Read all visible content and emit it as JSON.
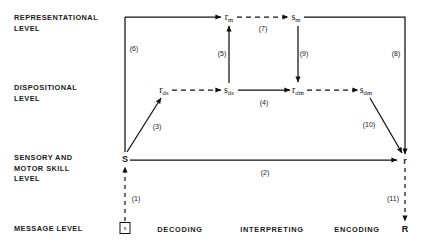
{
  "diagram": {
    "row_labels": [
      {
        "id": "representational",
        "text": "REPRESENTATIONAL\nLEVEL",
        "x": 14,
        "y": 13
      },
      {
        "id": "dispositional",
        "text": "DISPOSITIONAL\nLEVEL",
        "x": 14,
        "y": 83
      },
      {
        "id": "sensory-motor",
        "text": "SENSORY AND\nMOTOR SKILL\nLEVEL",
        "x": 14,
        "y": 153
      },
      {
        "id": "message",
        "text": "MESSAGE LEVEL",
        "x": 14,
        "y": 224
      }
    ],
    "nodes": [
      {
        "id": "r-m",
        "base": "r",
        "sub": "m",
        "x": 229,
        "y": 17,
        "style": "italic"
      },
      {
        "id": "s-m",
        "base": "s",
        "sub": "m",
        "x": 296,
        "y": 17,
        "style": "italic"
      },
      {
        "id": "r-ds",
        "base": "r",
        "sub": "ds",
        "x": 164,
        "y": 90,
        "style": "italic"
      },
      {
        "id": "s-ds",
        "base": "s",
        "sub": "ds",
        "x": 229,
        "y": 90,
        "style": "italic"
      },
      {
        "id": "r-dm",
        "base": "r",
        "sub": "dm",
        "x": 298,
        "y": 90,
        "style": "italic"
      },
      {
        "id": "s-dm",
        "base": "s",
        "sub": "dm",
        "x": 366,
        "y": 90,
        "style": "italic"
      },
      {
        "id": "S",
        "base": "S",
        "sub": "",
        "x": 125,
        "y": 159,
        "style": "big"
      },
      {
        "id": "r",
        "base": "r",
        "sub": "",
        "x": 405,
        "y": 161,
        "style": "big"
      },
      {
        "id": "R",
        "base": "R",
        "sub": "",
        "x": 405,
        "y": 229,
        "style": "big"
      }
    ],
    "message_box": {
      "id": "message-stimulus",
      "label": "s",
      "x": 125,
      "y": 228
    },
    "edge_labels": [
      {
        "id": "edge-1",
        "text": "(1)",
        "x": 136,
        "y": 198
      },
      {
        "id": "edge-2",
        "text": "(2)",
        "x": 265,
        "y": 172
      },
      {
        "id": "edge-3",
        "text": "(3)",
        "x": 157,
        "y": 126
      },
      {
        "id": "edge-4",
        "text": "(4)",
        "x": 264,
        "y": 102
      },
      {
        "id": "edge-5",
        "text": "(5)",
        "x": 222,
        "y": 53
      },
      {
        "id": "edge-6",
        "text": "(6)",
        "x": 134,
        "y": 48
      },
      {
        "id": "edge-7",
        "text": "(7)",
        "x": 263,
        "y": 28
      },
      {
        "id": "edge-8",
        "text": "(8)",
        "x": 396,
        "y": 53
      },
      {
        "id": "edge-9",
        "text": "(9)",
        "x": 304,
        "y": 53
      },
      {
        "id": "edge-10",
        "text": "(10)",
        "x": 369,
        "y": 124
      },
      {
        "id": "edge-11",
        "text": "(11)",
        "x": 393,
        "y": 198
      }
    ],
    "bottom_labels": [
      {
        "id": "decoding",
        "text": "DECODING",
        "x": 180,
        "y": 229
      },
      {
        "id": "interpreting",
        "text": "INTERPRETING",
        "x": 272,
        "y": 229
      },
      {
        "id": "encoding",
        "text": "ENCODING",
        "x": 357,
        "y": 229
      }
    ],
    "colors": {
      "ink": "#111111",
      "background": "#ffffff"
    }
  }
}
